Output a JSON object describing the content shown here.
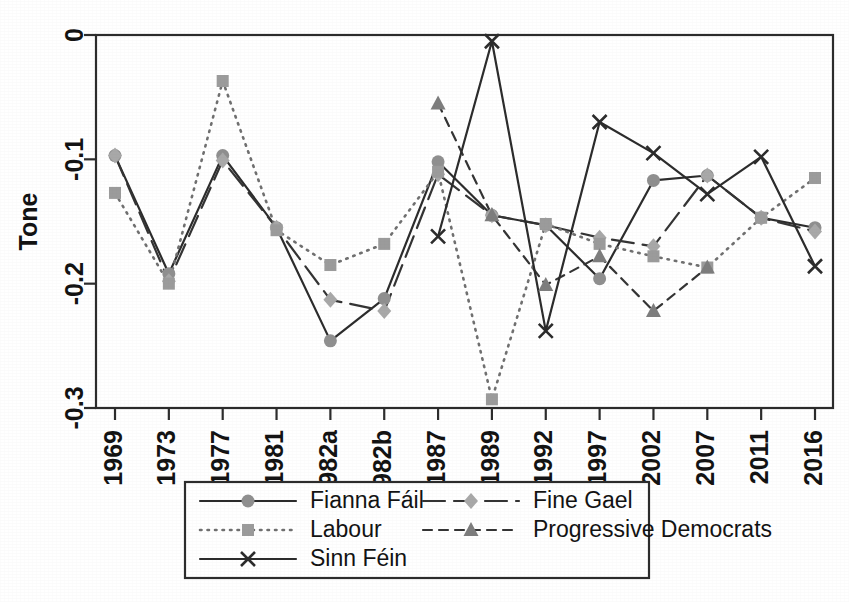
{
  "figure": {
    "y_axis_title": "Tone",
    "y_ticks": [
      "0",
      "-0.1",
      "-0.2",
      "-0.3"
    ],
    "x_ticks": [
      "1969",
      "1973",
      "1977",
      "1981",
      "1982a",
      "1982b",
      "1987",
      "1989",
      "1992",
      "1997",
      "2002",
      "2007",
      "2011",
      "2016"
    ]
  },
  "legend": {
    "entries": [
      {
        "label": "Fianna Fáil",
        "dash": "none",
        "marker": "circle",
        "color": "#8f8f8f"
      },
      {
        "label": "Fine Gael",
        "dash": "long",
        "marker": "diamond",
        "color": "#a8a8a8"
      },
      {
        "label": "Labour",
        "dash": "dotted",
        "marker": "square",
        "color": "#9b9b9b"
      },
      {
        "label": "Progressive Democrats",
        "dash": "dashed",
        "marker": "triangle",
        "color": "#7d7d7d"
      },
      {
        "label": "Sinn Féin",
        "dash": "none",
        "marker": "x",
        "color": "#2b2b2b"
      }
    ]
  },
  "chart_data": {
    "type": "line",
    "title": "",
    "xlabel": "",
    "ylabel": "Tone",
    "ylim": [
      -0.3,
      0.0
    ],
    "grid": false,
    "legend_position": "bottom",
    "categories": [
      "1969",
      "1973",
      "1977",
      "1981",
      "1982a",
      "1982b",
      "1987",
      "1989",
      "1992",
      "1997",
      "2002",
      "2007",
      "2011",
      "2016"
    ],
    "series": [
      {
        "name": "Fianna Fáil",
        "marker": "circle",
        "dash": "none",
        "values": [
          -0.097,
          -0.192,
          -0.097,
          -0.155,
          -0.246,
          -0.212,
          -0.102,
          -0.145,
          -0.153,
          -0.196,
          -0.117,
          -0.113,
          -0.147,
          -0.155
        ]
      },
      {
        "name": "Fine Gael",
        "marker": "diamond",
        "dash": "long",
        "values": [
          -0.097,
          -0.198,
          -0.101,
          -0.155,
          -0.213,
          -0.222,
          -0.112,
          -0.145,
          -0.153,
          -0.163,
          -0.17,
          -0.113,
          -0.147,
          -0.158
        ]
      },
      {
        "name": "Labour",
        "marker": "square",
        "dash": "dotted",
        "values": [
          -0.127,
          -0.2,
          -0.037,
          -0.157,
          -0.185,
          -0.168,
          -0.11,
          -0.293,
          -0.152,
          -0.168,
          -0.178,
          -0.187,
          -0.147,
          -0.115
        ]
      },
      {
        "name": "Progressive Democrats",
        "marker": "triangle",
        "dash": "dashed",
        "values": [
          null,
          null,
          null,
          null,
          null,
          null,
          -0.055,
          -0.145,
          -0.201,
          -0.178,
          -0.222,
          -0.187,
          null,
          null
        ]
      },
      {
        "name": "Sinn Féin",
        "marker": "x",
        "dash": "none",
        "values": [
          null,
          null,
          null,
          null,
          null,
          null,
          -0.162,
          -0.005,
          -0.238,
          -0.07,
          -0.095,
          -0.128,
          -0.098,
          -0.186
        ]
      }
    ]
  }
}
